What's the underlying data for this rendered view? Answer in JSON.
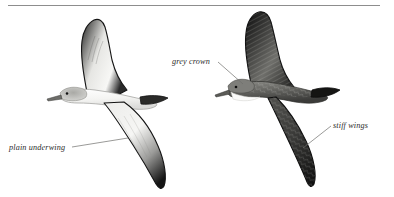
{
  "plate": {
    "kind": "bird-identification-plate",
    "background_color": "#ffffff",
    "rule": {
      "color": "#8d8d8d"
    }
  },
  "annotations": [
    {
      "id": "plain-underwing",
      "text": "plain underwing",
      "target": "left-bird-underwing"
    },
    {
      "id": "grey-crown",
      "text": "grey crown",
      "target": "right-bird-head"
    },
    {
      "id": "stiff-wings",
      "text": "stiff wings",
      "target": "right-bird-lower-wing"
    }
  ],
  "figures": [
    {
      "id": "left-bird",
      "name": "shearwater-underside",
      "view": "underside",
      "description": "shearwater in flight seen from below, pale white underwing and body, dark wing edges and wingtips, grey crown",
      "colors": {
        "body": "#f2f2f0",
        "wing_edge": "#171717",
        "cap": "#8f8f8f"
      }
    },
    {
      "id": "right-bird",
      "name": "shearwater-upperside",
      "view": "upperside",
      "description": "shearwater in flight seen from above, dark mottled grey-brown upperwings, grey crown, white throat, stiff straight wings",
      "colors": {
        "upperwing": "#4a4a4a",
        "wing_dark": "#1a1a1a",
        "throat": "#ffffff",
        "cap": "#7c7c7c"
      }
    }
  ]
}
